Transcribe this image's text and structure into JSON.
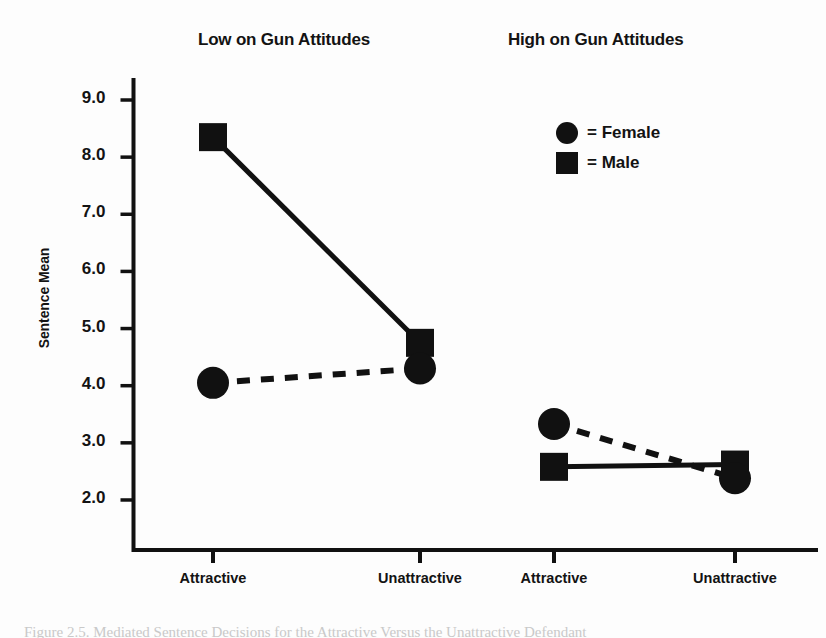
{
  "figure": {
    "background_color": "#fdfdfd",
    "ink_color": "#111111"
  },
  "panels": {
    "low_title": "Low on Gun Attitudes",
    "high_title": "High on Gun Attitudes"
  },
  "legend": {
    "female_label": "= Female",
    "male_label": "= Male",
    "female_marker": "circle-marker",
    "male_marker": "square-marker"
  },
  "caption": {
    "text": "Figure 2.5.  Mediated Sentence Decisions for the Attractive Versus the Unattractive Defendant"
  },
  "chart_data": {
    "type": "line",
    "title": "",
    "subtitle": "",
    "xlabel": "",
    "ylabel": "Sentence Mean",
    "categories": [
      "Attractive",
      "Unattractive",
      "Attractive",
      "Unattractive"
    ],
    "group_labels": [
      "Low on Gun Attitudes",
      "High on Gun Attitudes"
    ],
    "ylim": [
      1.6,
      9.5
    ],
    "yticks": [
      "2.0",
      "3.0",
      "4.0",
      "5.0",
      "6.0",
      "7.0",
      "8.0",
      "9.0"
    ],
    "ytick_values": [
      2.0,
      3.0,
      4.0,
      5.0,
      6.0,
      7.0,
      8.0,
      9.0
    ],
    "grid": false,
    "legend_position": "upper-right",
    "series": [
      {
        "name": "Male",
        "marker": "square",
        "linestyle": "solid",
        "color": "#111111",
        "values": [
          8.35,
          4.75,
          2.58,
          2.62
        ],
        "segments": [
          [
            8.35,
            4.75
          ],
          [
            2.58,
            2.62
          ]
        ]
      },
      {
        "name": "Female",
        "marker": "circle",
        "linestyle": "dashed",
        "color": "#111111",
        "values": [
          4.05,
          4.3,
          3.33,
          2.38
        ],
        "segments": [
          [
            4.05,
            4.3
          ],
          [
            3.33,
            2.38
          ]
        ]
      }
    ]
  }
}
